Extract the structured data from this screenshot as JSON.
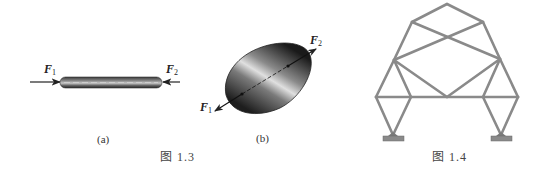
{
  "figure_1_3": {
    "caption": "图 1.3",
    "panel_a": {
      "label": "(a)",
      "force_left": {
        "symbol": "F",
        "subscript": "1"
      },
      "force_right": {
        "symbol": "F",
        "subscript": "2"
      },
      "description": "Two-force rod in compression"
    },
    "panel_b": {
      "label": "(b)",
      "force_upper": {
        "symbol": "F",
        "subscript": "2"
      },
      "force_lower": {
        "symbol": "F",
        "subscript": "1"
      },
      "description": "Rigid body under two equal and opposite forces"
    }
  },
  "figure_1_4": {
    "caption": "图 1.4",
    "description": "Truss structure on two pinned supports",
    "member_color": "#8a8a8a"
  }
}
